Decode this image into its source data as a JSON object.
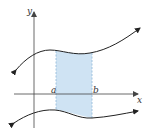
{
  "diagram": {
    "type": "area-between-curves",
    "labels": {
      "y_axis": "y",
      "x_axis": "x",
      "left_bound": "a",
      "right_bound": "b"
    },
    "colors": {
      "shade_fill": "#cfe3f3",
      "shade_border": "#8fb8d8",
      "curve": "#222222",
      "axis": "#444444"
    }
  }
}
